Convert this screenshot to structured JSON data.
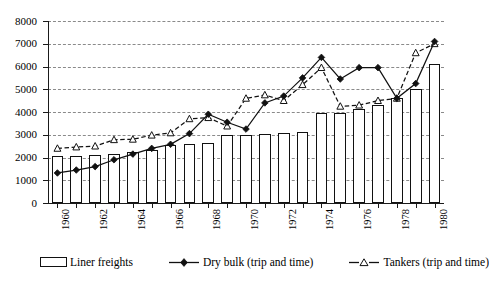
{
  "chart_data": {
    "type": "bar",
    "title": "",
    "subtitle": "",
    "xlabel": "",
    "ylabel": "",
    "ylim": [
      0,
      8000
    ],
    "ytick_step": 1000,
    "yticks": [
      "0",
      "1000",
      "2000",
      "3000",
      "4000",
      "5000",
      "6000",
      "7000",
      "8000"
    ],
    "grid": true,
    "grid_style": "horizontal dashed",
    "legend_position": "below axis",
    "x": [
      1960,
      1961,
      1962,
      1963,
      1964,
      1965,
      1966,
      1967,
      1968,
      1969,
      1970,
      1971,
      1972,
      1973,
      1974,
      1975,
      1976,
      1977,
      1978,
      1979,
      1980
    ],
    "categories": [
      "1960",
      "1961",
      "1962",
      "1963",
      "1964",
      "1965",
      "1966",
      "1967",
      "1968",
      "1969",
      "1970",
      "1971",
      "1972",
      "1973",
      "1974",
      "1975",
      "1976",
      "1977",
      "1978",
      "1979",
      "1980"
    ],
    "xtick_labels": [
      "1960",
      "1962",
      "1964",
      "1966",
      "1968",
      "1970",
      "1972",
      "1974",
      "1976",
      "1978",
      "1980"
    ],
    "series": [
      {
        "name": "Liner freights",
        "type": "bar",
        "marker": "open-bar",
        "values": [
          2080,
          2080,
          2090,
          2150,
          2250,
          2330,
          2560,
          2600,
          2620,
          2980,
          2990,
          3020,
          3060,
          3120,
          3950,
          3950,
          4150,
          4300,
          4600,
          5000,
          6100
        ]
      },
      {
        "name": "Dry bulk (trip and time)",
        "type": "line",
        "marker": "filled-diamond",
        "line_style": "solid",
        "values": [
          1320,
          1450,
          1600,
          1900,
          2150,
          2400,
          2580,
          3050,
          3900,
          3550,
          3250,
          4400,
          4700,
          5500,
          6400,
          5450,
          5950,
          5950,
          4600,
          5250,
          7100
        ]
      },
      {
        "name": "Tankers (trip and time)",
        "type": "line",
        "marker": "open-triangle",
        "line_style": "dashed",
        "values": [
          2400,
          2460,
          2500,
          2780,
          2800,
          2980,
          3080,
          3700,
          3750,
          3380,
          4600,
          4750,
          4500,
          5200,
          5950,
          4250,
          4300,
          4500,
          4600,
          6600,
          7000
        ]
      }
    ],
    "legend": [
      {
        "label": "Liner freights",
        "marker": "open-bar"
      },
      {
        "label": "Dry bulk (trip and time)",
        "marker": "filled-diamond-solid-line"
      },
      {
        "label": "Tankers (trip and time)",
        "marker": "open-triangle-dashed-line"
      }
    ],
    "colors": {
      "bar_fill": "#ffffff",
      "bar_stroke": "#111111",
      "dry_bulk_line": "#111111",
      "tankers_line": "#111111",
      "gridline": "#8a8a8a",
      "axis": "#1a1a1a"
    }
  }
}
